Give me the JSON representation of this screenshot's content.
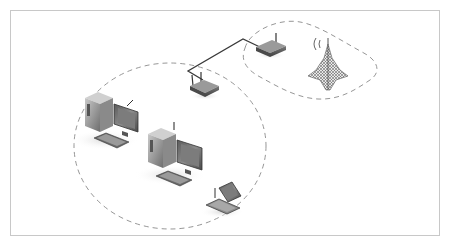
{
  "diagram": {
    "type": "network-topology",
    "style": "isometric grayscale illustration",
    "colors": {
      "frame": "#c8c8c8",
      "dashed_boundary": "#8a8a8a",
      "cable": "#3a3a3a",
      "device_dark": "#4a4a4a",
      "device_mid": "#7a7a7a",
      "device_light": "#b0b0b0",
      "background": "#ffffff"
    },
    "nodes": [
      {
        "id": "router-upper",
        "kind": "wireless-router",
        "label": ""
      },
      {
        "id": "router-lower",
        "kind": "wireless-router",
        "label": ""
      },
      {
        "id": "tower",
        "kind": "radio-tower",
        "label": ""
      },
      {
        "id": "pc-1",
        "kind": "desktop-computer-wireless",
        "label": ""
      },
      {
        "id": "pc-2",
        "kind": "desktop-computer-wireless",
        "label": ""
      },
      {
        "id": "laptop",
        "kind": "laptop-wireless",
        "label": ""
      }
    ],
    "edges": [
      {
        "from": "router-lower",
        "to": "router-upper",
        "kind": "wired-cable"
      }
    ],
    "regions": [
      {
        "id": "local-wireless-zone",
        "shape": "dashed-ellipse",
        "contains": [
          "router-lower",
          "pc-1",
          "pc-2",
          "laptop"
        ]
      },
      {
        "id": "uplink-wireless-zone",
        "shape": "dashed-rounded-region",
        "contains": [
          "router-upper",
          "tower"
        ]
      }
    ]
  }
}
